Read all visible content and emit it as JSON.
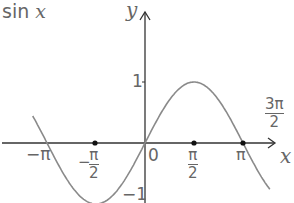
{
  "title": "sin x",
  "chart_data": {
    "type": "line",
    "title": "sin x",
    "xlabel": "x",
    "ylabel": "y",
    "function": "y = sin x",
    "x_ticks": [
      "-π",
      "-π/2",
      "0",
      "π/2",
      "π",
      "3π/2"
    ],
    "y_ticks": [
      "1",
      "-1"
    ],
    "marked_points": [
      {
        "x": "-π/2",
        "y": 0
      },
      {
        "x": "π/2",
        "y": 0
      },
      {
        "x": "π",
        "y": 0
      }
    ],
    "x": [
      -3.6,
      -3.1416,
      -1.5708,
      0,
      1.5708,
      3.1416,
      4.0
    ],
    "y": [
      0.44,
      0,
      -1,
      0,
      1,
      0,
      -0.76
    ],
    "xlim": [
      -4.6,
      4.6
    ],
    "ylim": [
      -1.0,
      2.3
    ],
    "grid": false,
    "legend": null
  },
  "labels": {
    "fn": "sin",
    "fn_var": "x",
    "y_axis": "y",
    "x_axis": "x",
    "one": "1",
    "neg_one": "−1",
    "zero": "0",
    "neg_pi": "−π",
    "neg_sign": "−",
    "pi": "π",
    "two": "2",
    "three_pi": "3π"
  },
  "colors": {
    "curve": "#8a8a8a",
    "axis": "#333333",
    "text": "#666666"
  }
}
